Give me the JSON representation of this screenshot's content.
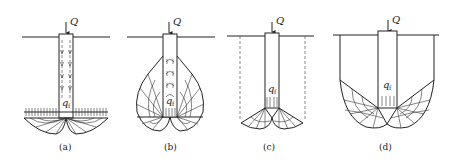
{
  "figure": {
    "panels": [
      {
        "id": "a",
        "label": "(a)",
        "load_symbol": "Q",
        "tip_symbol": "q",
        "tip_subscript": "f"
      },
      {
        "id": "b",
        "label": "(b)",
        "load_symbol": "Q",
        "tip_symbol": "q",
        "tip_subscript": "f"
      },
      {
        "id": "c",
        "label": "(c)",
        "load_symbol": "Q",
        "tip_symbol": "q",
        "tip_subscript": "f"
      },
      {
        "id": "d",
        "label": "(d)",
        "load_symbol": "Q",
        "tip_symbol": "q",
        "tip_subscript": "f"
      }
    ]
  }
}
